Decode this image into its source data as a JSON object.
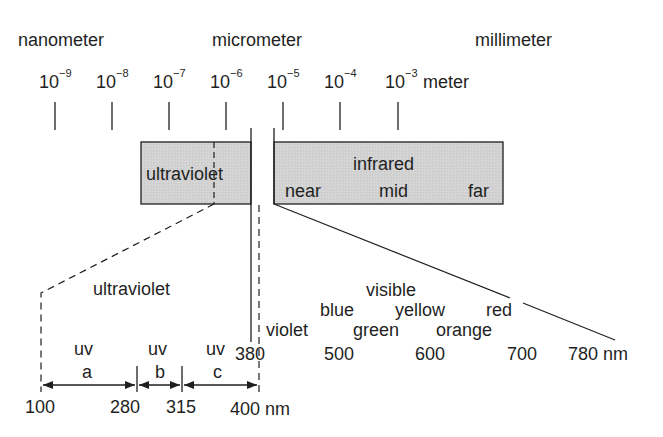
{
  "units": {
    "nanometer": "nanometer",
    "micrometer": "micrometer",
    "millimeter": "millimeter"
  },
  "scale": {
    "base": "10",
    "exponents": [
      "−9",
      "−8",
      "−7",
      "−6",
      "−5",
      "−4",
      "−3"
    ],
    "unit": "meter"
  },
  "bands": {
    "ultraviolet_box": "ultraviolet",
    "infrared_box": {
      "title": "infrared",
      "near": "near",
      "mid": "mid",
      "far": "far"
    }
  },
  "uv_detail": {
    "title": "ultraviolet",
    "sub_bands": [
      {
        "top": "uv",
        "letter": "a"
      },
      {
        "top": "uv",
        "letter": "b"
      },
      {
        "top": "uv",
        "letter": "c"
      }
    ],
    "ticks": [
      "100",
      "280",
      "315",
      "400 nm"
    ]
  },
  "visible_detail": {
    "title": "visible",
    "colors_row1": [
      "blue",
      "yellow",
      "red"
    ],
    "colors_row2": [
      "violet",
      "green",
      "orange"
    ],
    "ticks": [
      "380",
      "500",
      "600",
      "700",
      "780 nm"
    ]
  },
  "colors": {
    "box_fill": "#d4d4d4",
    "line": "#1f1f1f",
    "background": "#ffffff"
  }
}
